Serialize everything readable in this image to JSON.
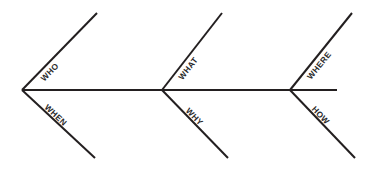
{
  "diagram": {
    "type": "fishbone",
    "background_color": "#ffffff",
    "line_color": "#231f20",
    "label_color": "#2b2b2b",
    "spine": {
      "x1": 22,
      "y1": 90,
      "x2": 337,
      "y2": 90
    },
    "bones": [
      {
        "id": "who",
        "label": "WHO",
        "position": "upper",
        "joint_x": 22,
        "x1": 22,
        "y1": 90,
        "x2": 97,
        "y2": 13,
        "stroke_width": 2.0,
        "label_t": 0.3,
        "label_offset": 8
      },
      {
        "id": "what",
        "label": "WHAT",
        "position": "upper",
        "joint_x": 162,
        "x1": 162,
        "y1": 90,
        "x2": 222,
        "y2": 13,
        "stroke_width": 2.0,
        "label_t": 0.34,
        "label_offset": 8
      },
      {
        "id": "where",
        "label": "WHERE",
        "position": "upper",
        "joint_x": 290,
        "x1": 290,
        "y1": 90,
        "x2": 352,
        "y2": 13,
        "stroke_width": 2.0,
        "label_t": 0.38,
        "label_offset": 8
      },
      {
        "id": "when",
        "label": "WHEN",
        "position": "lower",
        "joint_x": 22,
        "x1": 22,
        "y1": 90,
        "x2": 95,
        "y2": 158,
        "stroke_width": 2.0,
        "label_t": 0.42,
        "label_offset": -4
      },
      {
        "id": "why",
        "label": "WHY",
        "position": "lower",
        "joint_x": 162,
        "x1": 162,
        "y1": 90,
        "x2": 228,
        "y2": 158,
        "stroke_width": 2.0,
        "label_t": 0.44,
        "label_offset": -4
      },
      {
        "id": "how",
        "label": "HOW",
        "position": "lower",
        "joint_x": 290,
        "x1": 290,
        "y1": 90,
        "x2": 355,
        "y2": 158,
        "stroke_width": 2.0,
        "label_t": 0.42,
        "label_offset": -4
      }
    ]
  }
}
